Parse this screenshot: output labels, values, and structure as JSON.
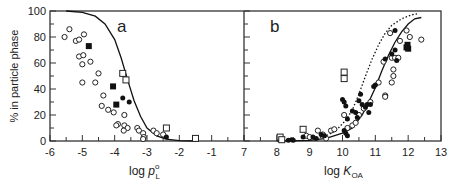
{
  "chart_data": [
    {
      "type": "scatter",
      "panel_label": "a",
      "xlabel": "log p°L",
      "ylabel": "% in particle phase",
      "xlim": [
        -6,
        0
      ],
      "ylim": [
        0,
        100
      ],
      "xticks": [
        -6,
        -5,
        -4,
        -3,
        -2,
        -1
      ],
      "yticks": [
        0,
        20,
        40,
        60,
        80,
        100
      ],
      "grid": false,
      "series": [
        {
          "name": "open circles",
          "marker": "open-circle",
          "points": [
            [
              -5.55,
              80
            ],
            [
              -5.4,
              86
            ],
            [
              -5.2,
              77
            ],
            [
              -5.1,
              78
            ],
            [
              -4.95,
              82
            ],
            [
              -5.1,
              65
            ],
            [
              -4.97,
              66
            ],
            [
              -5.0,
              59
            ],
            [
              -4.75,
              61
            ],
            [
              -5.0,
              45
            ],
            [
              -4.6,
              45
            ],
            [
              -4.5,
              52
            ],
            [
              -4.35,
              35
            ],
            [
              -4.4,
              27
            ],
            [
              -4.2,
              24
            ],
            [
              -4.03,
              22
            ],
            [
              -3.9,
              13
            ],
            [
              -3.95,
              12
            ],
            [
              -3.7,
              20
            ],
            [
              -3.7,
              12
            ],
            [
              -3.6,
              10
            ],
            [
              -3.72,
              8
            ],
            [
              -3.3,
              10
            ],
            [
              -3.25,
              8
            ],
            [
              -3.12,
              6
            ],
            [
              -3.1,
              3
            ],
            [
              -3.12,
              1.5
            ],
            [
              -2.8,
              8
            ],
            [
              -2.7,
              6
            ],
            [
              -2.5,
              5
            ]
          ]
        },
        {
          "name": "filled squares",
          "marker": "filled-square",
          "points": [
            [
              -4.8,
              73
            ],
            [
              -4.05,
              42
            ],
            [
              -3.95,
              28
            ]
          ]
        },
        {
          "name": "open squares",
          "marker": "open-square",
          "points": [
            [
              -3.75,
              52
            ],
            [
              -3.65,
              47
            ],
            [
              -2.4,
              10
            ],
            [
              -1.5,
              2
            ]
          ]
        },
        {
          "name": "filled circles",
          "marker": "filled-circle",
          "points": [
            [
              -3.75,
              33
            ],
            [
              -3.55,
              30
            ],
            [
              -2.4,
              3
            ]
          ]
        }
      ],
      "curve": {
        "name": "model",
        "style": "solid",
        "points": [
          [
            -5.5,
            100
          ],
          [
            -5.0,
            99
          ],
          [
            -4.6,
            96
          ],
          [
            -4.3,
            90
          ],
          [
            -4.0,
            78
          ],
          [
            -3.8,
            64
          ],
          [
            -3.6,
            47
          ],
          [
            -3.4,
            31
          ],
          [
            -3.2,
            19
          ],
          [
            -3.0,
            10
          ],
          [
            -2.7,
            4
          ],
          [
            -2.4,
            1.5
          ],
          [
            -2.0,
            0.3
          ],
          [
            -1.5,
            0
          ]
        ]
      }
    },
    {
      "type": "scatter",
      "panel_label": "b",
      "xlabel": "log KOA",
      "ylabel": "% in particle phase",
      "xlim": [
        7,
        13
      ],
      "ylim": [
        0,
        100
      ],
      "xticks": [
        7,
        8,
        9,
        10,
        11,
        12,
        13
      ],
      "yticks": [
        0,
        20,
        40,
        60,
        80,
        100
      ],
      "grid": false,
      "series": [
        {
          "name": "open circles",
          "marker": "open-circle",
          "points": [
            [
              8.9,
              4
            ],
            [
              9.0,
              3
            ],
            [
              9.25,
              8
            ],
            [
              9.4,
              5
            ],
            [
              9.5,
              2
            ],
            [
              9.65,
              8
            ],
            [
              9.75,
              9
            ],
            [
              10.05,
              20
            ],
            [
              10.15,
              10
            ],
            [
              10.3,
              12
            ],
            [
              10.4,
              14
            ],
            [
              10.5,
              20
            ],
            [
              10.65,
              25
            ],
            [
              10.85,
              30
            ],
            [
              11.1,
              45
            ],
            [
              11.3,
              35
            ],
            [
              11.3,
              34
            ],
            [
              11.25,
              61
            ],
            [
              11.5,
              64
            ],
            [
              11.55,
              55
            ],
            [
              11.55,
              50
            ],
            [
              11.5,
              45
            ],
            [
              11.6,
              64
            ],
            [
              11.7,
              64
            ],
            [
              11.45,
              83
            ],
            [
              11.75,
              77
            ],
            [
              11.95,
              85
            ],
            [
              12.05,
              80
            ],
            [
              12.4,
              78
            ]
          ]
        },
        {
          "name": "filled circles",
          "marker": "filled-circle",
          "points": [
            [
              8.35,
              0.5
            ],
            [
              8.45,
              1
            ],
            [
              8.5,
              0.5
            ],
            [
              8.8,
              3
            ],
            [
              9.1,
              3
            ],
            [
              9.2,
              2
            ],
            [
              9.35,
              5
            ],
            [
              9.45,
              4
            ],
            [
              10.0,
              32
            ],
            [
              10.05,
              30
            ],
            [
              10.1,
              27
            ],
            [
              10.15,
              17
            ],
            [
              10.05,
              8
            ],
            [
              10.1,
              6
            ],
            [
              10.15,
              4
            ],
            [
              10.3,
              23
            ],
            [
              10.4,
              22
            ],
            [
              10.45,
              18
            ],
            [
              10.5,
              31
            ],
            [
              10.55,
              36
            ],
            [
              10.6,
              28
            ],
            [
              10.7,
              26
            ],
            [
              10.75,
              28
            ],
            [
              10.85,
              28
            ],
            [
              10.8,
              22
            ],
            [
              10.95,
              42
            ],
            [
              11.0,
              43
            ],
            [
              11.3,
              63
            ],
            [
              11.5,
              67
            ],
            [
              11.6,
              70
            ],
            [
              11.65,
              62
            ],
            [
              11.6,
              85
            ]
          ]
        },
        {
          "name": "filled squares",
          "marker": "filled-square",
          "points": [
            [
              11.95,
              72
            ],
            [
              11.98,
              74
            ],
            [
              12.0,
              71
            ]
          ]
        },
        {
          "name": "open squares",
          "marker": "open-square",
          "points": [
            [
              8.1,
              3
            ],
            [
              8.8,
              9
            ],
            [
              10.05,
              53
            ],
            [
              10.05,
              48
            ],
            [
              8.15,
              1
            ]
          ]
        }
      ],
      "curves": [
        {
          "name": "model solid",
          "style": "solid",
          "points": [
            [
              8.0,
              0
            ],
            [
              9.0,
              0.5
            ],
            [
              9.5,
              2
            ],
            [
              10.0,
              6
            ],
            [
              10.3,
              10
            ],
            [
              10.6,
              20
            ],
            [
              10.8,
              30
            ],
            [
              11.0,
              41
            ],
            [
              11.2,
              54
            ],
            [
              11.4,
              66
            ],
            [
              11.6,
              76
            ],
            [
              11.8,
              84
            ],
            [
              12.0,
              90
            ],
            [
              12.2,
              94
            ],
            [
              12.4,
              95
            ]
          ]
        },
        {
          "name": "model dotted",
          "style": "dotted",
          "points": [
            [
              9.0,
              1
            ],
            [
              9.5,
              4
            ],
            [
              9.8,
              8
            ],
            [
              10.1,
              16
            ],
            [
              10.3,
              24
            ],
            [
              10.5,
              36
            ],
            [
              10.7,
              50
            ],
            [
              10.9,
              63
            ],
            [
              11.1,
              74
            ],
            [
              11.3,
              83
            ],
            [
              11.5,
              89
            ],
            [
              11.8,
              94
            ],
            [
              12.1,
              97
            ],
            [
              12.3,
              98
            ]
          ]
        }
      ]
    }
  ],
  "labels": {
    "ylabel": "% in particle phase",
    "panel_a": "a",
    "panel_b": "b",
    "xlabel_a_prefix": "log ",
    "xlabel_a_symbol": "p",
    "xlabel_a_sup": "o",
    "xlabel_a_sub": "L",
    "xlabel_b_prefix": "log ",
    "xlabel_b_symbol": "K",
    "xlabel_b_sub": "OA"
  }
}
